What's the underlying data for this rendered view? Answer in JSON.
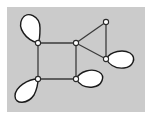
{
  "figure": {
    "canvas": {
      "width": 152,
      "height": 122
    },
    "panel": {
      "x": 7,
      "y": 7,
      "width": 138,
      "height": 105,
      "fill": "#cccccc",
      "border": "#ffffff"
    },
    "colors": {
      "background": "#ffffff",
      "panel_fill": "#cbcbcb",
      "edge_stroke": "#3b3b3b",
      "loop_stroke": "#1a1a1a",
      "loop_fill": "#ffffff",
      "vertex_fill": "#ffffff",
      "vertex_stroke": "#2a2a2a"
    },
    "stroke_widths": {
      "edge": 1.3,
      "loop": 1.4,
      "vertex": 1.1
    },
    "vertex_radius": 2.6
  },
  "graph": {
    "vertex_count": 6,
    "edge_count": 6,
    "loop_count": 4,
    "vertices": [
      {
        "id": "v1",
        "label": "top-left",
        "x": 38,
        "y": 43,
        "degree": 4
      },
      {
        "id": "v2",
        "label": "top-middle",
        "x": 76,
        "y": 43,
        "degree": 3
      },
      {
        "id": "v3",
        "label": "bottom-left",
        "x": 38,
        "y": 79,
        "degree": 4
      },
      {
        "id": "v4",
        "label": "bottom-middle",
        "x": 76,
        "y": 79,
        "degree": 4
      },
      {
        "id": "v5",
        "label": "top-right",
        "x": 106,
        "y": 22,
        "degree": 2
      },
      {
        "id": "v6",
        "label": "right",
        "x": 106,
        "y": 59,
        "degree": 4
      }
    ],
    "edges": [
      {
        "id": "e1",
        "from": "v1",
        "to": "v2",
        "name": "square-top"
      },
      {
        "id": "e2",
        "from": "v1",
        "to": "v3",
        "name": "square-left"
      },
      {
        "id": "e3",
        "from": "v3",
        "to": "v4",
        "name": "square-bottom"
      },
      {
        "id": "e4",
        "from": "v2",
        "to": "v4",
        "name": "square-right"
      },
      {
        "id": "e5",
        "from": "v2",
        "to": "v5",
        "name": "triangle-upper"
      },
      {
        "id": "e6",
        "from": "v2",
        "to": "v6",
        "name": "triangle-lower"
      },
      {
        "id": "e7",
        "from": "v5",
        "to": "v6",
        "name": "triangle-right"
      }
    ],
    "loops": [
      {
        "id": "l1",
        "at": "v1",
        "direction": "up-left",
        "path": "M 38 43 C 26 40 17 28 22 19 C 27 10 40 16 40 28 C 40 35 40 40 38 43 Z"
      },
      {
        "id": "l2",
        "at": "v3",
        "direction": "down-left",
        "path": "M 38 79 C 28 79 15 87 15 96 C 15 105 28 104 34 95 C 37 89 38 83 38 79 Z"
      },
      {
        "id": "l3",
        "at": "v4",
        "direction": "right",
        "path": "M 76 79 C 80 71 92 68 99 72 C 106 76 102 86 93 87 C 85 88 79 84 76 79 Z"
      },
      {
        "id": "l4",
        "at": "v6",
        "direction": "right",
        "path": "M 106 59 C 111 51 123 49 130 53 C 137 58 133 67 124 68 C 115 69 109 64 106 59 Z"
      }
    ]
  }
}
